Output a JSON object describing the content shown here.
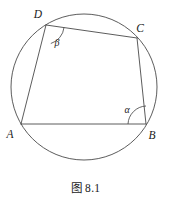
{
  "figure": {
    "caption": "图 8.1",
    "line_color": "#4a4a4a",
    "label_color": "#1a1a1a",
    "background_color": "#ffffff",
    "circle": {
      "name": "circumscribed-circle",
      "cx": 84,
      "cy": 87,
      "r": 73
    },
    "vertices": [
      {
        "id": "A",
        "label": "A",
        "x": 21,
        "y": 124,
        "label_x": 10,
        "label_y": 138
      },
      {
        "id": "B",
        "label": "B",
        "x": 146,
        "y": 124,
        "label_x": 152,
        "label_y": 139
      },
      {
        "id": "C",
        "label": "C",
        "x": 137,
        "y": 38,
        "label_x": 140,
        "label_y": 32
      },
      {
        "id": "D",
        "label": "D",
        "x": 46,
        "y": 25,
        "label_x": 38,
        "label_y": 18
      }
    ],
    "sides": [
      {
        "id": "AB",
        "name": "side-ab",
        "x1": 21,
        "y1": 124,
        "x2": 146,
        "y2": 124
      },
      {
        "id": "BC",
        "name": "side-bc",
        "x1": 146,
        "y1": 124,
        "x2": 137,
        "y2": 38
      },
      {
        "id": "CD",
        "name": "side-cd",
        "x1": 137,
        "y1": 38,
        "x2": 46,
        "y2": 25
      },
      {
        "id": "DA",
        "name": "side-da",
        "x1": 46,
        "y1": 25,
        "x2": 21,
        "y2": 124
      }
    ],
    "angles": [
      {
        "id": "alpha",
        "label": "α",
        "at_vertex": "B",
        "label_x": 127,
        "label_y": 113,
        "arc_path": "M 146 106 A 19 19 0 0 0 128 124"
      },
      {
        "id": "beta",
        "label": "β",
        "at_vertex": "D",
        "label_x": 57,
        "label_y": 46,
        "arc_path": "M 64 27.5 A 19 19 0 0 1 50.8 43.5"
      }
    ]
  }
}
